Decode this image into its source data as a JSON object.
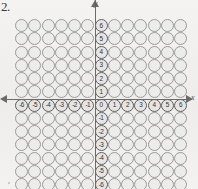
{
  "question_number": "2.",
  "axes": {
    "y_axis_label": "y",
    "x_axis_label": "x",
    "x_tick_labels": [
      "-6",
      "-5",
      "-4",
      "-3",
      "-2",
      "-1",
      "0",
      "1",
      "2",
      "3",
      "4",
      "5",
      "6"
    ],
    "y_tick_labels": [
      "6",
      "5",
      "4",
      "3",
      "2",
      "1",
      "0",
      "-1",
      "-2",
      "-3",
      "-4",
      "-5",
      "-6"
    ],
    "origin_label": "0"
  },
  "chart_data": {
    "type": "scatter",
    "title": "",
    "xlabel": "x",
    "ylabel": "y",
    "grid": true,
    "legend": false,
    "xlim": [
      -6,
      6
    ],
    "ylim": [
      -6,
      6
    ],
    "x": [
      -6,
      -5,
      -4,
      -3,
      -2,
      -1,
      0,
      1,
      2,
      3,
      4,
      5,
      6
    ],
    "y": [
      6,
      5,
      4,
      3,
      2,
      1,
      0,
      -1,
      -2,
      -3,
      -4,
      -5,
      -6
    ],
    "rows": 13,
    "columns": 13,
    "marker": "open-circle"
  },
  "colors": {
    "paper": "#f2f1ef",
    "circle_fill": "#ececea",
    "circle_stroke": "#9a9a9a",
    "axis": "#6b6b6b",
    "text": "#2f2f2f"
  }
}
